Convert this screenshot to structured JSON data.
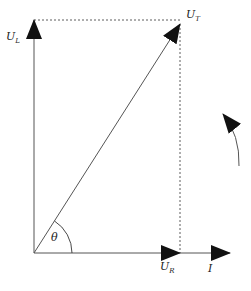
{
  "diagram": {
    "colors": {
      "line": "#555555",
      "arrow": "#111111",
      "text": "#222222",
      "background": "#ffffff"
    },
    "origin": {
      "x": 34,
      "y": 253
    },
    "vectors": [
      {
        "id": "U_L",
        "label_main": "U",
        "label_sub": "L",
        "from": [
          34,
          253
        ],
        "to": [
          34,
          20
        ],
        "label_pos": [
          6,
          40
        ]
      },
      {
        "id": "U_T",
        "label_main": "U",
        "label_sub": "T",
        "from": [
          34,
          253
        ],
        "to": [
          180,
          24
        ],
        "label_pos": [
          186,
          18
        ]
      },
      {
        "id": "U_R",
        "label_main": "U",
        "label_sub": "R",
        "from": [
          34,
          253
        ],
        "to": [
          180,
          253
        ],
        "label_pos": [
          160,
          270
        ]
      },
      {
        "id": "I",
        "label_main": "I",
        "label_sub": "",
        "from": [
          180,
          253
        ],
        "to": [
          230,
          253
        ],
        "label_pos": [
          208,
          272
        ]
      }
    ],
    "dashed_lines": [
      {
        "from": [
          34,
          20
        ],
        "to": [
          180,
          20
        ]
      },
      {
        "from": [
          180,
          24
        ],
        "to": [
          180,
          253
        ]
      }
    ],
    "angle": {
      "label": "θ",
      "radius": 38,
      "label_pos": [
        51,
        241
      ]
    },
    "rotation_arrow": {
      "direction": "counterclockwise",
      "start": [
        239,
        166
      ],
      "end": [
        222,
        112
      ]
    }
  }
}
